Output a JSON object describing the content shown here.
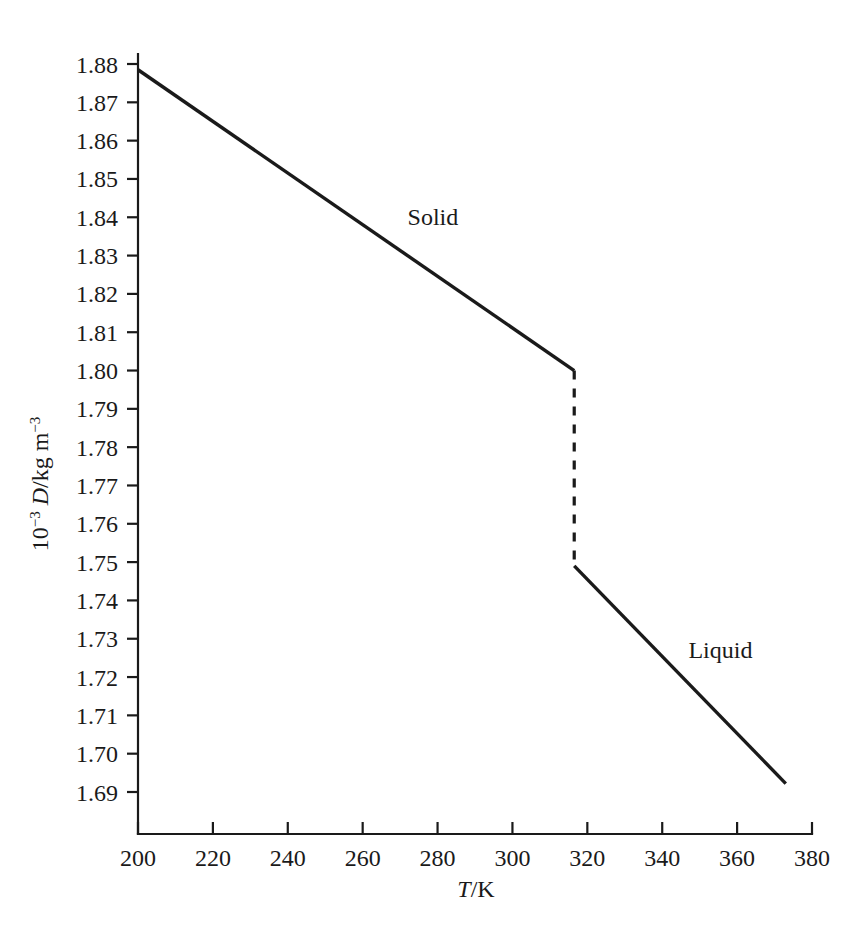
{
  "chart_data": {
    "type": "line",
    "title": "",
    "subtitle": "",
    "xlabel_plain": "T/K",
    "xlabel_parts": {
      "symbol": "T",
      "rest": "/K"
    },
    "ylabel_plain": "10-3 D/kg m-3",
    "ylabel_parts": {
      "base": "10",
      "exp1": "−3",
      "symbol": " D",
      "mid": "/kg m",
      "exp2": "−3"
    },
    "xlim": [
      200,
      380
    ],
    "ylim": [
      1.685,
      1.88
    ],
    "xticks": [
      200,
      220,
      240,
      260,
      280,
      300,
      320,
      340,
      360,
      380
    ],
    "xtick_labels": [
      "200",
      "220",
      "240",
      "260",
      "280",
      "300",
      "320",
      "340",
      "360",
      "380"
    ],
    "yticks": [
      1.69,
      1.7,
      1.71,
      1.72,
      1.73,
      1.74,
      1.75,
      1.76,
      1.77,
      1.78,
      1.79,
      1.8,
      1.81,
      1.82,
      1.83,
      1.84,
      1.85,
      1.86,
      1.87,
      1.88
    ],
    "ytick_labels": [
      "1.69",
      "1.70",
      "1.71",
      "1.72",
      "1.73",
      "1.74",
      "1.75",
      "1.76",
      "1.77",
      "1.78",
      "1.79",
      "1.80",
      "1.81",
      "1.82",
      "1.83",
      "1.84",
      "1.85",
      "1.86",
      "1.87",
      "1.88"
    ],
    "grid": false,
    "legend_position": "inline-annotations",
    "annotations": [
      {
        "text": "Solid",
        "x": 272,
        "y": 1.838
      },
      {
        "text": "Liquid",
        "x": 347,
        "y": 1.725
      }
    ],
    "series": [
      {
        "name": "Solid",
        "style": "solid",
        "x": [
          200,
          316.5
        ],
        "values": [
          1.8785,
          1.8
        ]
      },
      {
        "name": "Melting transition",
        "style": "dashed",
        "x": [
          316.5,
          316.5
        ],
        "values": [
          1.8,
          1.749
        ]
      },
      {
        "name": "Liquid",
        "style": "solid",
        "x": [
          316.5,
          373
        ],
        "values": [
          1.749,
          1.6922
        ]
      }
    ],
    "colors": {
      "line": "#1a1a1a",
      "background": "#ffffff"
    }
  }
}
